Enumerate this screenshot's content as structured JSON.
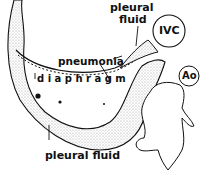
{
  "labels": {
    "pleural_fluid_top_line1": "pleural",
    "pleural_fluid_top_line2": "fluid",
    "ivc": "IVC",
    "pneumonia": "pneumonia",
    "diaphragm": "d i a p h r a g m",
    "ao": "Ao",
    "pleural_fluid_bottom": "pleural fluid"
  },
  "colors": {
    "ink": "#111111",
    "background": "#ffffff",
    "stipple": "#9a9a9a"
  }
}
